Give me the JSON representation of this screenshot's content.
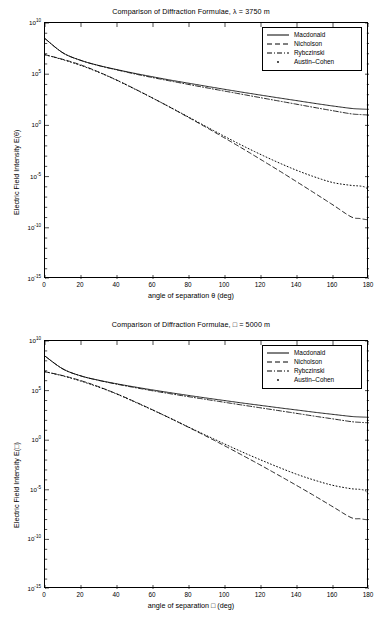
{
  "figures": [
    {
      "title": "Comparison of Diffraction Formulae, λ = 3750 m",
      "xlabel": "angle of separation θ (deg)",
      "ylabel": "Electric Field Intensity E(θ)",
      "legend": [
        "Macdonald",
        "Nicholson",
        "Rybczinski",
        "Austin–Cohen"
      ],
      "xticks": [
        "0",
        "20",
        "40",
        "60",
        "80",
        "100",
        "120",
        "140",
        "160",
        "180"
      ],
      "yticks": [
        "10",
        "10",
        "10",
        "10",
        "10",
        "10"
      ],
      "yexponents": [
        "10",
        "5",
        "0",
        "-5",
        "-10",
        "-15"
      ]
    },
    {
      "title": "Comparison of Diffraction Formulae, □ = 5000 m",
      "xlabel": "angle of separation □ (deg)",
      "ylabel": "Electric Field Intensity E(□)",
      "legend": [
        "Macdonald",
        "Nicholson",
        "Rybczinski",
        "Austin–Cohen"
      ],
      "xticks": [
        "0",
        "20",
        "40",
        "60",
        "80",
        "100",
        "120",
        "140",
        "160",
        "180"
      ],
      "yticks": [
        "10",
        "10",
        "10",
        "10",
        "10",
        "10"
      ],
      "yexponents": [
        "10",
        "5",
        "0",
        "-5",
        "-10",
        "-15"
      ]
    }
  ],
  "chart_data": [
    {
      "type": "line",
      "title": "Comparison of Diffraction Formulae, λ = 3750 m",
      "xlabel": "angle of separation θ (deg)",
      "ylabel": "Electric Field Intensity E(θ)",
      "xlim": [
        0,
        180
      ],
      "ylim": [
        1e-15,
        10000000000.0
      ],
      "yscale": "log",
      "grid": false,
      "legend_position": "top-right",
      "xticks": [
        0,
        20,
        40,
        60,
        80,
        100,
        120,
        140,
        160,
        180
      ],
      "yticks": [
        10000000000.0,
        100000.0,
        1.0,
        1e-05,
        1e-10,
        1e-15
      ],
      "x": [
        0,
        10,
        20,
        30,
        40,
        50,
        60,
        70,
        80,
        90,
        100,
        110,
        120,
        130,
        140,
        150,
        160,
        170,
        175,
        178,
        180
      ],
      "series": [
        {
          "name": "Macdonald",
          "style": "solid",
          "values": [
            300000000.0,
            12000000.0,
            2200000.0,
            700000.0,
            280000.0,
            120000.0,
            55000.0,
            26000.0,
            13000.0,
            6500.0,
            3300.0,
            1700.0,
            900.0,
            480.0,
            260.0,
            140.0,
            78.0,
            46.0,
            40.0,
            38.0,
            37.0
          ]
        },
        {
          "name": "Nicholson",
          "style": "dashed",
          "values": [
            8000000.0,
            2800000.0,
            800000.0,
            160000.0,
            26000.0,
            3600.0,
            450.0,
            52.0,
            5.6,
            0.58,
            0.056,
            0.0052,
            0.00045,
            3.8e-05,
            3e-06,
            2.3e-07,
            1.7e-08,
            1.2e-09,
            8e-10,
            6.5e-10,
            6e-10
          ]
        },
        {
          "name": "Rybczinski",
          "style": "dashdot",
          "values": [
            300000000.0,
            12000000.0,
            2200000.0,
            680000.0,
            260000.0,
            105000.0,
            46000.0,
            21000.0,
            9800.0,
            4600.0,
            2200.0,
            1050.0,
            500.0,
            240.0,
            115.0,
            55.0,
            27.0,
            13.5,
            11.5,
            10.8,
            10.5
          ]
        },
        {
          "name": "Austin–Cohen",
          "style": "dotted",
          "values": [
            8000000.0,
            2600000.0,
            700000.0,
            150000.0,
            25000.0,
            3400.0,
            440.0,
            54.0,
            6.2,
            0.7,
            0.08,
            0.01,
            0.0014,
            0.00022,
            4e-05,
            9e-06,
            2.6e-06,
            1.4e-06,
            1.2e-06,
            9e-07,
            4e-07
          ]
        }
      ]
    },
    {
      "type": "line",
      "title": "Comparison of Diffraction Formulae, □ = 5000 m",
      "xlabel": "angle of separation □ (deg)",
      "ylabel": "Electric Field Intensity E(□)",
      "xlim": [
        0,
        180
      ],
      "ylim": [
        1e-15,
        10000000000.0
      ],
      "yscale": "log",
      "grid": false,
      "legend_position": "top-right",
      "xticks": [
        0,
        20,
        40,
        60,
        80,
        100,
        120,
        140,
        160,
        180
      ],
      "yticks": [
        10000000000.0,
        100000.0,
        1.0,
        1e-05,
        1e-10,
        1e-15
      ],
      "x": [
        0,
        10,
        20,
        30,
        40,
        50,
        60,
        70,
        80,
        90,
        100,
        110,
        120,
        130,
        140,
        150,
        160,
        170,
        175,
        178,
        180
      ],
      "series": [
        {
          "name": "Macdonald",
          "style": "solid",
          "values": [
            300000000.0,
            15000000.0,
            3000000.0,
            1100000.0,
            480000.0,
            230000.0,
            115000.0,
            60000.0,
            32000.0,
            17500.0,
            9800.0,
            5500.0,
            3200.0,
            1850.0,
            1100.0,
            650.0,
            400.0,
            250.0,
            220.0,
            210.0,
            200.0
          ]
        },
        {
          "name": "Nicholson",
          "style": "dashed",
          "values": [
            8000000.0,
            3200000.0,
            1000000.0,
            240000.0,
            46000.0,
            7500.0,
            1100.0,
            150.0,
            19.0,
            2.3,
            0.26,
            0.028,
            0.0029,
            0.00028,
            2.6e-05,
            2.3e-06,
            1.9e-07,
            1.6e-08,
            1.2e-08,
            1e-08,
            9.5e-09
          ]
        },
        {
          "name": "Rybczinski",
          "style": "dashdot",
          "values": [
            300000000.0,
            15000000.0,
            3000000.0,
            1050000.0,
            440000.0,
            200000.0,
            94000.0,
            47000.0,
            24000.0,
            12500.0,
            6500.0,
            3400.0,
            1800.0,
            950.0,
            500.0,
            260.0,
            140.0,
            75.0,
            63.0,
            59.0,
            57.0
          ]
        },
        {
          "name": "Austin–Cohen",
          "style": "dotted",
          "values": [
            8000000.0,
            3000000.0,
            900000.0,
            220000.0,
            44000.0,
            7000.0,
            1050.0,
            150.0,
            20.0,
            2.8,
            0.4,
            0.06,
            0.01,
            0.0018,
            0.00036,
            9e-05,
            2.8e-05,
            1.3e-05,
            1.1e-05,
            8e-06,
            3e-06
          ]
        }
      ]
    }
  ]
}
